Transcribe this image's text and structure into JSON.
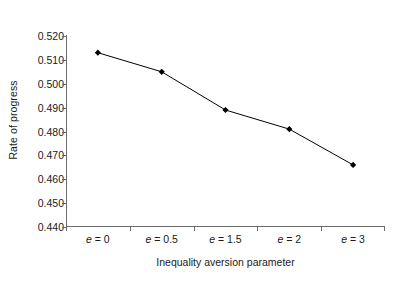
{
  "chart_data": {
    "type": "line",
    "title": "",
    "subtitle": "",
    "xlabel": "Inequality aversion parameter",
    "ylabel": "Rate of progress",
    "categories": [
      "e = 0",
      "e = 0.5",
      "e = 1.5",
      "e = 2",
      "e = 3"
    ],
    "category_parts": [
      {
        "symbol": "e",
        "relation": " = ",
        "value": "0"
      },
      {
        "symbol": "e",
        "relation": " = ",
        "value": "0.5"
      },
      {
        "symbol": "e",
        "relation": " = ",
        "value": "1.5"
      },
      {
        "symbol": "e",
        "relation": " = ",
        "value": "2"
      },
      {
        "symbol": "e",
        "relation": " = ",
        "value": "3"
      }
    ],
    "values": [
      0.513,
      0.505,
      0.489,
      0.481,
      0.466
    ],
    "ylim": [
      0.44,
      0.52
    ],
    "ytick_values": [
      0.52,
      0.51,
      0.5,
      0.49,
      0.48,
      0.47,
      0.46,
      0.45,
      0.44
    ],
    "ytick_labels": [
      "0.520",
      "0.510",
      "0.500",
      "0.490",
      "0.480",
      "0.470",
      "0.460",
      "0.450",
      "0.440"
    ],
    "grid": false,
    "legend": false,
    "legend_position": "none",
    "marker": "diamond",
    "marker_color": "#000000",
    "line_color": "#000000",
    "axis_color": "#6b6b6b",
    "background_color": "#ffffff",
    "annotations": []
  }
}
